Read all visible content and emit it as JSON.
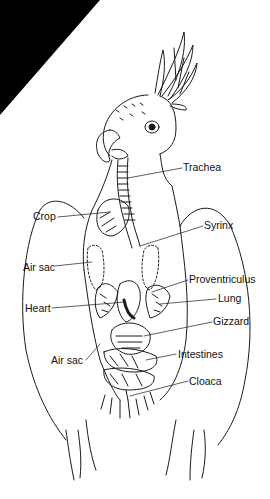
{
  "diagram": {
    "line_color": "#1a1a1a",
    "background_color": "#ffffff",
    "corner_color": "#000000",
    "labels": [
      {
        "id": "trachea",
        "text": "Trachea",
        "x": 183,
        "y": 161
      },
      {
        "id": "crop",
        "text": "Crop",
        "x": 33,
        "y": 210
      },
      {
        "id": "syrinx",
        "text": "Syrinx",
        "x": 204,
        "y": 219
      },
      {
        "id": "air-sac-upper",
        "text": "Air sac",
        "x": 23,
        "y": 261
      },
      {
        "id": "proventriculus",
        "text": "Proventriculus",
        "x": 189,
        "y": 273
      },
      {
        "id": "heart",
        "text": "Heart",
        "x": 25,
        "y": 302
      },
      {
        "id": "lung",
        "text": "Lung",
        "x": 218,
        "y": 292
      },
      {
        "id": "gizzard",
        "text": "Gizzard",
        "x": 213,
        "y": 315
      },
      {
        "id": "air-sac-lower",
        "text": "Air sac",
        "x": 51,
        "y": 354
      },
      {
        "id": "intestines",
        "text": "Intestines",
        "x": 178,
        "y": 348
      },
      {
        "id": "cloaca",
        "text": "Cloaca",
        "x": 189,
        "y": 375
      }
    ]
  }
}
